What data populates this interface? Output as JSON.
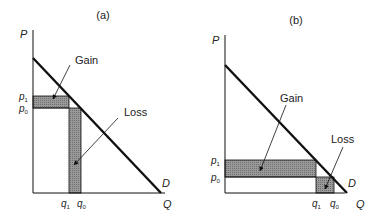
{
  "panels": [
    {
      "id": "a",
      "title": "(a)",
      "y_axis_label": "P",
      "x_axis_label": "Q",
      "curve_label": "D",
      "price_labels": {
        "p1": "p",
        "p1_sub": "1",
        "p0": "p",
        "p0_sub": "0"
      },
      "quantity_labels": {
        "q1": "q",
        "q1_sub": "1",
        "q0": "q",
        "q0_sub": "0"
      },
      "gain_label": "Gain",
      "loss_label": "Loss"
    },
    {
      "id": "b",
      "title": "(b)",
      "y_axis_label": "P",
      "x_axis_label": "Q",
      "curve_label": "D",
      "price_labels": {
        "p1": "p",
        "p1_sub": "1",
        "p0": "p",
        "p0_sub": "0"
      },
      "quantity_labels": {
        "q1": "q",
        "q1_sub": "1",
        "q0": "q",
        "q0_sub": "0"
      },
      "gain_label": "Gain",
      "loss_label": "Loss"
    }
  ],
  "colors": {
    "line": "#111111",
    "shade": "#8a8a8a",
    "background": "#ffffff"
  }
}
